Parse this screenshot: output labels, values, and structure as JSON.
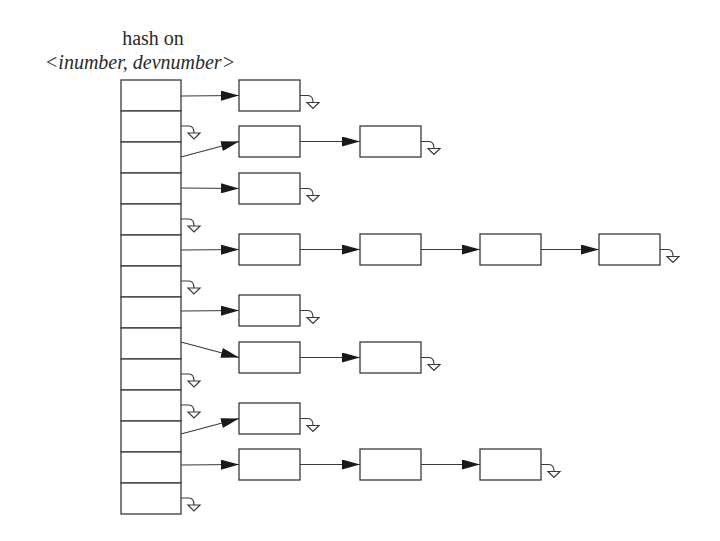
{
  "title": {
    "line1": "hash on",
    "line2": "<inumber, devnumber>"
  },
  "colors": {
    "stroke": "#3a3a3a",
    "background": "#ffffff"
  },
  "hash_table": {
    "x": 121,
    "y": 80,
    "width": 60,
    "slot_height": 31,
    "slots": [
      {
        "index": 0,
        "type": "chain",
        "chain": 0
      },
      {
        "index": 1,
        "type": "null"
      },
      {
        "index": 2,
        "type": "chain",
        "chain": 1
      },
      {
        "index": 3,
        "type": "chain",
        "chain": 2
      },
      {
        "index": 4,
        "type": "null"
      },
      {
        "index": 5,
        "type": "chain",
        "chain": 3
      },
      {
        "index": 6,
        "type": "null"
      },
      {
        "index": 7,
        "type": "chain",
        "chain": 4
      },
      {
        "index": 8,
        "type": "chain",
        "chain": 5
      },
      {
        "index": 9,
        "type": "null"
      },
      {
        "index": 10,
        "type": "null"
      },
      {
        "index": 11,
        "type": "chain",
        "chain": 6
      },
      {
        "index": 12,
        "type": "chain",
        "chain": 7
      },
      {
        "index": 13,
        "type": "null"
      }
    ]
  },
  "chains": [
    {
      "from_slot": 0,
      "start_y": 96,
      "row_y": 80,
      "nodes": 1
    },
    {
      "from_slot": 2,
      "start_y": 157,
      "row_y": 126,
      "nodes": 2
    },
    {
      "from_slot": 3,
      "start_y": 188,
      "row_y": 173,
      "nodes": 1
    },
    {
      "from_slot": 5,
      "start_y": 250,
      "row_y": 234,
      "nodes": 4
    },
    {
      "from_slot": 7,
      "start_y": 311,
      "row_y": 295,
      "nodes": 1
    },
    {
      "from_slot": 8,
      "start_y": 342,
      "row_y": 342,
      "nodes": 2
    },
    {
      "from_slot": 11,
      "start_y": 434,
      "row_y": 403,
      "nodes": 1
    },
    {
      "from_slot": 12,
      "start_y": 465,
      "row_y": 449,
      "nodes": 3
    }
  ],
  "node_layout": {
    "columns_x": [
      239,
      360,
      480,
      599
    ],
    "width": 61,
    "height": 31
  },
  "null_grounds_from_table": [
    {
      "slot": 1,
      "y": 126
    },
    {
      "slot": 4,
      "y": 219
    },
    {
      "slot": 6,
      "y": 281
    },
    {
      "slot": 9,
      "y": 374
    },
    {
      "slot": 10,
      "y": 405
    },
    {
      "slot": 13,
      "y": 498
    }
  ]
}
